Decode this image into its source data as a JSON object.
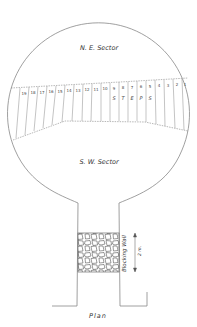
{
  "diagram": {
    "title": "Plan",
    "sectors": {
      "north_east": "N. E. Sector",
      "south_west": "S. W. Sector"
    },
    "steps": {
      "label_letters": [
        "S",
        "T",
        "E",
        "P",
        "S"
      ],
      "label": "STEPS",
      "numbers": [
        "19",
        "18",
        "17",
        "16",
        "15",
        "14",
        "13",
        "12",
        "11",
        "10",
        "9",
        "8",
        "7",
        "6",
        "5",
        "4",
        "3",
        "2",
        "1"
      ]
    },
    "blocking_wall": {
      "label": "Blocking Wall",
      "dimension": "2 m."
    },
    "colors": {
      "line": "#888888",
      "text": "#333333",
      "background": "#ffffff"
    }
  }
}
